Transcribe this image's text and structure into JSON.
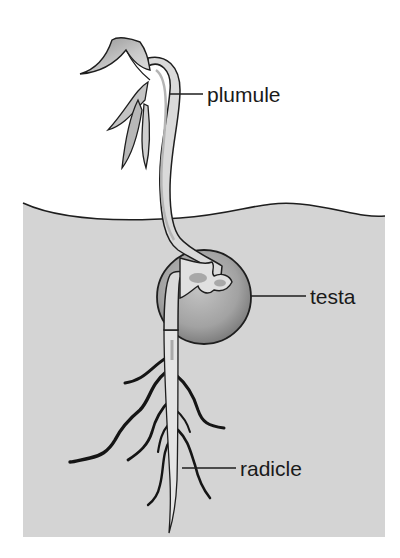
{
  "diagram": {
    "labels": [
      {
        "id": "plumule",
        "text": "plumule"
      },
      {
        "id": "testa",
        "text": "testa"
      },
      {
        "id": "radicle",
        "text": "radicle"
      }
    ],
    "colors": {
      "soil": "#d4d4d4",
      "seed_light": "#b8b8b8",
      "seed_dark": "#8a8a8a",
      "outline": "#1e1e1e",
      "stem_fill": "#dcdcdc",
      "leaf_fill": "#b0b0b0"
    }
  }
}
